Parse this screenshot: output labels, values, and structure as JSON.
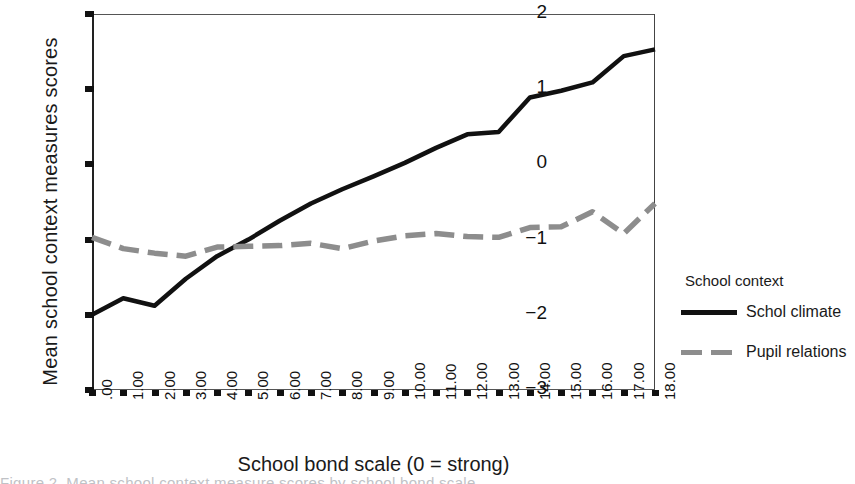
{
  "chart_data": {
    "type": "line",
    "title": "",
    "xlabel": "School bond scale (0 = strong)",
    "ylabel": "Mean school context measures scores",
    "xlim": [
      0,
      18
    ],
    "ylim": [
      -3,
      2
    ],
    "grid": false,
    "legend_position": "right",
    "legend_title": "School context",
    "x": [
      0,
      1,
      2,
      3,
      4,
      5,
      6,
      7,
      8,
      9,
      10,
      11,
      12,
      13,
      14,
      15,
      16,
      17,
      18
    ],
    "xtick_labels": [
      ".00",
      "1.00",
      "2.00",
      "3.00",
      "4.00",
      "5.00",
      "6.00",
      "7.00",
      "8.00",
      "9.00",
      "10.00",
      "11.00",
      "12.00",
      "13.00",
      "14.00",
      "15.00",
      "16.00",
      "17.00",
      "18.00"
    ],
    "ytick_labels": [
      "2",
      "1",
      "0",
      "-1",
      "-2",
      "-3"
    ],
    "ytick_values": [
      2,
      1,
      0,
      -1,
      -2,
      -3
    ],
    "series": [
      {
        "name": "Schol climate",
        "style": "solid",
        "color": "#111111",
        "values": [
          -2.0,
          -1.78,
          -1.88,
          -1.52,
          -1.22,
          -1.0,
          -0.75,
          -0.52,
          -0.33,
          -0.16,
          0.02,
          0.22,
          0.4,
          0.43,
          0.89,
          0.98,
          1.09,
          1.44,
          1.53
        ]
      },
      {
        "name": "Pupil relations",
        "style": "dashed",
        "color": "#8d8d8d",
        "values": [
          -0.97,
          -1.12,
          -1.18,
          -1.22,
          -1.1,
          -1.09,
          -1.08,
          -1.05,
          -1.12,
          -1.02,
          -0.95,
          -0.92,
          -0.96,
          -0.97,
          -0.84,
          -0.83,
          -0.63,
          -0.92,
          -0.52
        ]
      }
    ]
  },
  "axis": {
    "y_title": "Mean school context measures scores",
    "x_title": "School bond scale (0 = strong)"
  },
  "legend": {
    "title": "School context",
    "entries": [
      {
        "label": "Schol climate",
        "style": "solid"
      },
      {
        "label": "Pupil relations",
        "style": "dashed"
      }
    ]
  },
  "caption": {
    "text": "Figure 2.  Mean school context measure scores by school bond scale"
  }
}
